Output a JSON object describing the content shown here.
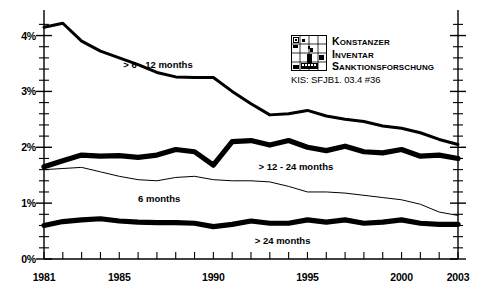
{
  "logo": {
    "mark_name": "kis-grid-logo",
    "line1": "Konstanzer",
    "line2": "Inventar",
    "line3": "Sanktionsforschung",
    "code": "KIS: SFJB1. 03.4 #36"
  },
  "chart_data": {
    "type": "line",
    "title": "",
    "xlabel": "",
    "ylabel": "",
    "xlim": [
      1981,
      2003
    ],
    "ylim": [
      0,
      4.35
    ],
    "grid": false,
    "legend": "inline-annotations",
    "y_tick_labels": [
      "0%",
      "1%",
      "2%",
      "3%",
      "4%"
    ],
    "y_tick_values": [
      0,
      1,
      2,
      3,
      4
    ],
    "y_minor_step": 0.2,
    "x_tick_labels": [
      "1981",
      "1985",
      "1990",
      "1995",
      "2000",
      "2003"
    ],
    "x_tick_values": [
      1981,
      1985,
      1990,
      1995,
      2000,
      2003
    ],
    "x_minor_step": 1,
    "x": [
      1981,
      1982,
      1983,
      1984,
      1985,
      1986,
      1987,
      1988,
      1989,
      1990,
      1991,
      1992,
      1993,
      1994,
      1995,
      1996,
      1997,
      1998,
      1999,
      2000,
      2001,
      2002,
      2003
    ],
    "series": [
      {
        "name": "> 6 - 12 months",
        "style": "thick",
        "width": 3.0,
        "color": "#000000",
        "label_x": 1985.0,
        "label_y": 3.47,
        "values": [
          4.15,
          4.22,
          3.9,
          3.72,
          3.6,
          3.48,
          3.34,
          3.26,
          3.25,
          3.25,
          3.0,
          2.78,
          2.58,
          2.6,
          2.66,
          2.56,
          2.5,
          2.46,
          2.38,
          2.34,
          2.26,
          2.14,
          2.05
        ]
      },
      {
        "name": "> 12 - 24 months",
        "style": "extra-thick",
        "width": 5.2,
        "color": "#000000",
        "label_x": 1992.4,
        "label_y": 1.64,
        "values": [
          1.65,
          1.76,
          1.86,
          1.84,
          1.85,
          1.82,
          1.86,
          1.96,
          1.92,
          1.68,
          2.1,
          2.12,
          2.04,
          2.12,
          2.0,
          1.94,
          2.02,
          1.92,
          1.9,
          1.96,
          1.84,
          1.86,
          1.8
        ]
      },
      {
        "name": "6 months",
        "style": "thin",
        "width": 1.0,
        "color": "#000000",
        "label_x": 1986.0,
        "label_y": 1.08,
        "values": [
          1.6,
          1.62,
          1.64,
          1.56,
          1.48,
          1.42,
          1.4,
          1.46,
          1.48,
          1.42,
          1.4,
          1.4,
          1.38,
          1.3,
          1.2,
          1.2,
          1.18,
          1.14,
          1.1,
          1.06,
          0.98,
          0.84,
          0.78
        ]
      },
      {
        "name": "> 24 months",
        "style": "extra-thick",
        "width": 5.2,
        "color": "#000000",
        "label_x": 1992.2,
        "label_y": 0.32,
        "values": [
          0.6,
          0.67,
          0.7,
          0.72,
          0.68,
          0.66,
          0.65,
          0.65,
          0.64,
          0.58,
          0.62,
          0.68,
          0.64,
          0.64,
          0.7,
          0.66,
          0.7,
          0.64,
          0.66,
          0.7,
          0.64,
          0.62,
          0.62
        ]
      }
    ]
  }
}
